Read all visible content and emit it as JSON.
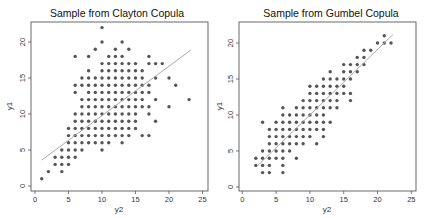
{
  "chart_data": [
    {
      "type": "scatter",
      "title": "Sample from Clayton Copula",
      "xlabel": "y2",
      "ylabel": "y1",
      "xlim": [
        0,
        25
      ],
      "ylim": [
        0,
        22
      ],
      "xticks": [
        0,
        5,
        10,
        15,
        20,
        25
      ],
      "yticks": [
        0,
        5,
        10,
        15,
        20
      ],
      "grid": false,
      "legend": null,
      "fit_line": {
        "x": [
          1,
          23.3
        ],
        "y": [
          3.6,
          18.9
        ]
      },
      "points": [
        [
          1,
          1
        ],
        [
          2,
          2
        ],
        [
          4,
          2
        ],
        [
          3,
          3
        ],
        [
          4,
          3
        ],
        [
          5,
          3
        ],
        [
          3,
          4
        ],
        [
          4,
          4
        ],
        [
          5,
          4
        ],
        [
          6,
          4
        ],
        [
          4,
          5
        ],
        [
          5,
          5
        ],
        [
          6,
          5
        ],
        [
          7,
          5
        ],
        [
          10,
          5
        ],
        [
          5,
          6
        ],
        [
          6,
          6
        ],
        [
          7,
          6
        ],
        [
          8,
          6
        ],
        [
          9,
          6
        ],
        [
          10,
          6
        ],
        [
          11,
          6
        ],
        [
          13,
          6
        ],
        [
          5,
          7
        ],
        [
          6,
          7
        ],
        [
          7,
          7
        ],
        [
          8,
          7
        ],
        [
          9,
          7
        ],
        [
          10,
          7
        ],
        [
          11,
          7
        ],
        [
          12,
          7
        ],
        [
          13,
          7
        ],
        [
          14,
          7
        ],
        [
          16,
          7
        ],
        [
          17,
          7
        ],
        [
          5,
          8
        ],
        [
          6,
          8
        ],
        [
          7,
          8
        ],
        [
          8,
          8
        ],
        [
          9,
          8
        ],
        [
          10,
          8
        ],
        [
          11,
          8
        ],
        [
          12,
          8
        ],
        [
          13,
          8
        ],
        [
          14,
          8
        ],
        [
          15,
          8
        ],
        [
          6,
          9
        ],
        [
          7,
          9
        ],
        [
          8,
          9
        ],
        [
          9,
          9
        ],
        [
          10,
          9
        ],
        [
          11,
          9
        ],
        [
          12,
          9
        ],
        [
          13,
          9
        ],
        [
          14,
          9
        ],
        [
          15,
          9
        ],
        [
          18,
          9
        ],
        [
          6,
          10
        ],
        [
          7,
          10
        ],
        [
          8,
          10
        ],
        [
          9,
          10
        ],
        [
          10,
          10
        ],
        [
          11,
          10
        ],
        [
          12,
          10
        ],
        [
          13,
          10
        ],
        [
          14,
          10
        ],
        [
          15,
          10
        ],
        [
          17,
          10
        ],
        [
          7,
          11
        ],
        [
          8,
          11
        ],
        [
          9,
          11
        ],
        [
          10,
          11
        ],
        [
          11,
          11
        ],
        [
          12,
          11
        ],
        [
          13,
          11
        ],
        [
          14,
          11
        ],
        [
          15,
          11
        ],
        [
          16,
          11
        ],
        [
          17,
          11
        ],
        [
          20,
          11
        ],
        [
          7,
          12
        ],
        [
          8,
          12
        ],
        [
          9,
          12
        ],
        [
          10,
          12
        ],
        [
          11,
          12
        ],
        [
          12,
          12
        ],
        [
          13,
          12
        ],
        [
          14,
          12
        ],
        [
          15,
          12
        ],
        [
          16,
          12
        ],
        [
          18,
          12
        ],
        [
          23,
          12
        ],
        [
          6,
          13
        ],
        [
          8,
          13
        ],
        [
          9,
          13
        ],
        [
          10,
          13
        ],
        [
          11,
          13
        ],
        [
          12,
          13
        ],
        [
          13,
          13
        ],
        [
          14,
          13
        ],
        [
          15,
          13
        ],
        [
          16,
          13
        ],
        [
          17,
          13
        ],
        [
          6,
          14
        ],
        [
          7,
          14
        ],
        [
          8,
          14
        ],
        [
          9,
          14
        ],
        [
          10,
          14
        ],
        [
          11,
          14
        ],
        [
          12,
          14
        ],
        [
          13,
          14
        ],
        [
          14,
          14
        ],
        [
          15,
          14
        ],
        [
          16,
          14
        ],
        [
          17,
          14
        ],
        [
          21,
          14
        ],
        [
          7,
          15
        ],
        [
          8,
          15
        ],
        [
          9,
          15
        ],
        [
          10,
          15
        ],
        [
          11,
          15
        ],
        [
          12,
          15
        ],
        [
          13,
          15
        ],
        [
          14,
          15
        ],
        [
          15,
          15
        ],
        [
          16,
          15
        ],
        [
          18,
          15
        ],
        [
          20,
          15
        ],
        [
          8,
          16
        ],
        [
          10,
          16
        ],
        [
          11,
          16
        ],
        [
          12,
          16
        ],
        [
          13,
          16
        ],
        [
          14,
          16
        ],
        [
          15,
          16
        ],
        [
          16,
          16
        ],
        [
          10,
          17
        ],
        [
          11,
          17
        ],
        [
          12,
          17
        ],
        [
          13,
          17
        ],
        [
          14,
          17
        ],
        [
          15,
          17
        ],
        [
          17,
          17
        ],
        [
          18,
          17
        ],
        [
          19,
          17
        ],
        [
          6,
          18
        ],
        [
          8,
          18
        ],
        [
          11,
          18
        ],
        [
          12,
          18
        ],
        [
          13,
          18
        ],
        [
          17,
          18
        ],
        [
          9,
          19
        ],
        [
          12,
          19
        ],
        [
          14,
          19
        ],
        [
          10,
          20
        ],
        [
          13,
          20
        ],
        [
          10,
          22
        ]
      ]
    },
    {
      "type": "scatter",
      "title": "Sample from Gumbel Copula",
      "xlabel": "y2",
      "ylabel": "y1",
      "xlim": [
        0,
        25
      ],
      "ylim": [
        0,
        22
      ],
      "xticks": [
        0,
        5,
        10,
        15,
        20,
        25
      ],
      "yticks": [
        0,
        5,
        10,
        15,
        20
      ],
      "grid": false,
      "legend": null,
      "fit_line": {
        "x": [
          2.3,
          22.3
        ],
        "y": [
          3.0,
          21.2
        ]
      },
      "points": [
        [
          3,
          2
        ],
        [
          4,
          2
        ],
        [
          6,
          2
        ],
        [
          2,
          3
        ],
        [
          3,
          3
        ],
        [
          4,
          3
        ],
        [
          6,
          3
        ],
        [
          2,
          4
        ],
        [
          3,
          4
        ],
        [
          4,
          4
        ],
        [
          5,
          4
        ],
        [
          6,
          4
        ],
        [
          8,
          4
        ],
        [
          3,
          5
        ],
        [
          4,
          5
        ],
        [
          5,
          5
        ],
        [
          6,
          5
        ],
        [
          7,
          5
        ],
        [
          4,
          6
        ],
        [
          5,
          6
        ],
        [
          6,
          6
        ],
        [
          7,
          6
        ],
        [
          8,
          6
        ],
        [
          9,
          6
        ],
        [
          11,
          6
        ],
        [
          4,
          7
        ],
        [
          5,
          7
        ],
        [
          6,
          7
        ],
        [
          7,
          7
        ],
        [
          8,
          7
        ],
        [
          9,
          7
        ],
        [
          10,
          7
        ],
        [
          12,
          7
        ],
        [
          4,
          8
        ],
        [
          5,
          8
        ],
        [
          6,
          8
        ],
        [
          7,
          8
        ],
        [
          8,
          8
        ],
        [
          9,
          8
        ],
        [
          10,
          8
        ],
        [
          11,
          8
        ],
        [
          12,
          8
        ],
        [
          3,
          9
        ],
        [
          5,
          9
        ],
        [
          6,
          9
        ],
        [
          7,
          9
        ],
        [
          8,
          9
        ],
        [
          9,
          9
        ],
        [
          10,
          9
        ],
        [
          11,
          9
        ],
        [
          12,
          9
        ],
        [
          13,
          9
        ],
        [
          6,
          10
        ],
        [
          7,
          10
        ],
        [
          8,
          10
        ],
        [
          9,
          10
        ],
        [
          10,
          10
        ],
        [
          11,
          10
        ],
        [
          12,
          10
        ],
        [
          6,
          11
        ],
        [
          8,
          11
        ],
        [
          9,
          11
        ],
        [
          10,
          11
        ],
        [
          11,
          11
        ],
        [
          12,
          11
        ],
        [
          13,
          11
        ],
        [
          14,
          11
        ],
        [
          9,
          12
        ],
        [
          10,
          12
        ],
        [
          11,
          12
        ],
        [
          12,
          12
        ],
        [
          13,
          12
        ],
        [
          14,
          12
        ],
        [
          16,
          12
        ],
        [
          10,
          13
        ],
        [
          11,
          13
        ],
        [
          12,
          13
        ],
        [
          13,
          13
        ],
        [
          14,
          13
        ],
        [
          15,
          13
        ],
        [
          16,
          13
        ],
        [
          10,
          14
        ],
        [
          11,
          14
        ],
        [
          12,
          14
        ],
        [
          13,
          14
        ],
        [
          14,
          14
        ],
        [
          15,
          14
        ],
        [
          12,
          15
        ],
        [
          13,
          15
        ],
        [
          14,
          15
        ],
        [
          15,
          15
        ],
        [
          16,
          15
        ],
        [
          13,
          16
        ],
        [
          15,
          16
        ],
        [
          16,
          16
        ],
        [
          17,
          16
        ],
        [
          15,
          17
        ],
        [
          16,
          17
        ],
        [
          17,
          17
        ],
        [
          18,
          17
        ],
        [
          17,
          18
        ],
        [
          18,
          18
        ],
        [
          18,
          19
        ],
        [
          19,
          19
        ],
        [
          20,
          20
        ],
        [
          21,
          20
        ],
        [
          22,
          20
        ],
        [
          21,
          21
        ]
      ]
    }
  ],
  "colors": {
    "points": "#555555",
    "fit_line": "#aaaaaa",
    "axes": "#444444",
    "text": "#222222"
  }
}
